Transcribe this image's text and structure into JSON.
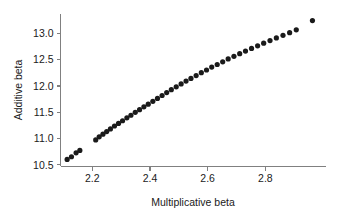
{
  "chart_data": {
    "type": "scatter",
    "title": "",
    "xlabel": "Multiplicative beta",
    "ylabel": "Additive beta",
    "xlim": [
      2.09,
      3.01
    ],
    "ylim": [
      10.47,
      13.37
    ],
    "xticks": [
      2.2,
      2.4,
      2.6,
      2.8
    ],
    "xticklabels": [
      "2.2",
      "2.4",
      "2.6",
      "2.8"
    ],
    "yticks": [
      10.5,
      11.0,
      11.5,
      12.0,
      12.5,
      13.0
    ],
    "yticklabels": [
      "10.5",
      "11.0",
      "11.5",
      "12.0",
      "12.5",
      "13.0"
    ],
    "grid": false,
    "legend": null,
    "marker": "filled-circle",
    "marker_color": "#1a1a1a",
    "marker_size_px": 2.6,
    "points": [
      {
        "x": 2.113,
        "y": 10.605
      },
      {
        "x": 2.128,
        "y": 10.655
      },
      {
        "x": 2.144,
        "y": 10.73
      },
      {
        "x": 2.157,
        "y": 10.775
      },
      {
        "x": 2.212,
        "y": 10.975
      },
      {
        "x": 2.224,
        "y": 11.035
      },
      {
        "x": 2.237,
        "y": 11.085
      },
      {
        "x": 2.25,
        "y": 11.135
      },
      {
        "x": 2.263,
        "y": 11.185
      },
      {
        "x": 2.277,
        "y": 11.24
      },
      {
        "x": 2.291,
        "y": 11.29
      },
      {
        "x": 2.305,
        "y": 11.34
      },
      {
        "x": 2.32,
        "y": 11.395
      },
      {
        "x": 2.334,
        "y": 11.445
      },
      {
        "x": 2.349,
        "y": 11.5
      },
      {
        "x": 2.364,
        "y": 11.55
      },
      {
        "x": 2.379,
        "y": 11.605
      },
      {
        "x": 2.394,
        "y": 11.655
      },
      {
        "x": 2.41,
        "y": 11.71
      },
      {
        "x": 2.426,
        "y": 11.765
      },
      {
        "x": 2.442,
        "y": 11.82
      },
      {
        "x": 2.458,
        "y": 11.875
      },
      {
        "x": 2.474,
        "y": 11.93
      },
      {
        "x": 2.491,
        "y": 11.985
      },
      {
        "x": 2.508,
        "y": 12.04
      },
      {
        "x": 2.525,
        "y": 12.095
      },
      {
        "x": 2.542,
        "y": 12.145
      },
      {
        "x": 2.56,
        "y": 12.2
      },
      {
        "x": 2.578,
        "y": 12.255
      },
      {
        "x": 2.596,
        "y": 12.305
      },
      {
        "x": 2.614,
        "y": 12.36
      },
      {
        "x": 2.633,
        "y": 12.41
      },
      {
        "x": 2.652,
        "y": 12.46
      },
      {
        "x": 2.671,
        "y": 12.515
      },
      {
        "x": 2.691,
        "y": 12.565
      },
      {
        "x": 2.711,
        "y": 12.615
      },
      {
        "x": 2.731,
        "y": 12.665
      },
      {
        "x": 2.752,
        "y": 12.715
      },
      {
        "x": 2.773,
        "y": 12.765
      },
      {
        "x": 2.794,
        "y": 12.815
      },
      {
        "x": 2.816,
        "y": 12.865
      },
      {
        "x": 2.838,
        "y": 12.915
      },
      {
        "x": 2.861,
        "y": 12.965
      },
      {
        "x": 2.884,
        "y": 13.015
      },
      {
        "x": 2.907,
        "y": 13.07
      },
      {
        "x": 2.963,
        "y": 13.245
      }
    ]
  },
  "axes": {
    "x_title": "Multiplicative beta",
    "y_title": "Additive beta"
  }
}
